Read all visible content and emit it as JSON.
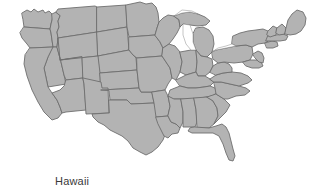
{
  "figure": {
    "background_color": "#ffffff",
    "map": {
      "title": "",
      "region": "contiguous-united-states",
      "fill_color": "#b3b3b3",
      "border_color": "#6e6e6e",
      "water_color": "#ffffff",
      "clipped_top": true
    },
    "labels": [
      {
        "name": "hawaii",
        "text": "Hawaii",
        "color": "#3a3a3a",
        "x": 55,
        "y": 175,
        "clipped_bottom": true
      }
    ]
  }
}
